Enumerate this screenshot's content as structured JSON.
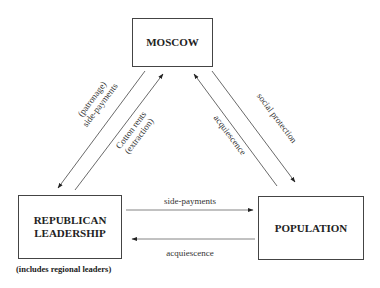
{
  "nodes": {
    "moscow": {
      "label": "MOSCOW"
    },
    "republican": {
      "line1": "REPUBLICAN",
      "line2": "LEADERSHIP",
      "note": "(includes regional leaders)"
    },
    "population": {
      "label": "POPULATION"
    }
  },
  "edges": {
    "moscow_to_republican": {
      "line1": "(patronage)",
      "line2": "side-payments"
    },
    "republican_to_moscow": {
      "line1": "Cotton rents",
      "line2": "(extraction)"
    },
    "population_to_moscow": {
      "label": "acquiescence"
    },
    "moscow_to_population": {
      "label": "social protection"
    },
    "republican_to_population": {
      "label": "side-payments"
    },
    "population_to_republican": {
      "label": "acquiescence"
    }
  }
}
